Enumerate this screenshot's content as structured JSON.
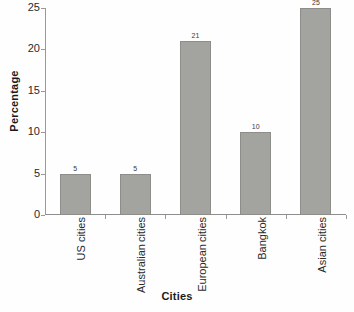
{
  "chart_data": {
    "type": "bar",
    "title": "",
    "xlabel": "Cities",
    "ylabel": "Percentage",
    "categories": [
      "US cities",
      "Australian cities",
      "European cities",
      "Bangkok",
      "Asian cities"
    ],
    "category_lines": [
      [
        "US cities"
      ],
      [
        "Australian",
        "cities"
      ],
      [
        "European",
        "cities"
      ],
      [
        "Bangkok"
      ],
      [
        "Asian cities"
      ]
    ],
    "values": [
      5,
      5,
      21,
      10,
      25
    ],
    "value_labels": [
      "5",
      "5",
      "21",
      "10",
      "25"
    ],
    "ylim": [
      0,
      25
    ],
    "yticks": [
      0,
      5,
      10,
      15,
      20,
      25
    ],
    "ytick_labels": [
      "0",
      "5",
      "10",
      "15",
      "20",
      "25"
    ],
    "grid": false,
    "legend": "none",
    "bar_color": "#a3a3a0",
    "bar_border_color": "#8d8d8a",
    "axis_color": "#9a9a9a",
    "text_color": "#2a2a2a"
  }
}
